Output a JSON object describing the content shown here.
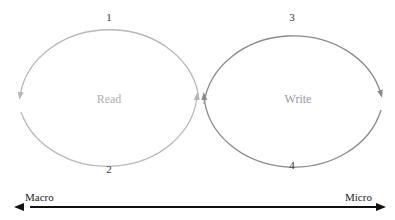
{
  "diagram": {
    "left_loop": {
      "label": "Read",
      "color": "#b8b8b8",
      "text_color": "#b0b0b0",
      "top_number": "1",
      "bottom_number": "2"
    },
    "right_loop": {
      "label": "Write",
      "color": "#8a8a8a",
      "text_color": "#999999",
      "top_number": "3",
      "bottom_number": "4"
    },
    "axis": {
      "left_label": "Macro",
      "right_label": "Micro",
      "color": "#111111"
    }
  }
}
